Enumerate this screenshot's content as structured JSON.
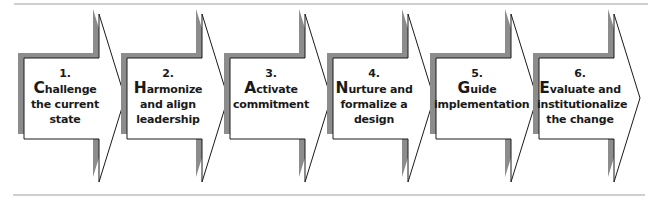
{
  "diagram": {
    "type": "process-chevrons",
    "colors": {
      "arrow_fill": "#ffffff",
      "arrow_outline": "#1a1a1a",
      "shadow": "#8c8c8c",
      "rule": "#cfcfcf",
      "text": "#1a1a1a"
    },
    "steps": [
      {
        "number": "1.",
        "initial": "C",
        "lines": [
          "hallenge",
          "the current",
          "state"
        ]
      },
      {
        "number": "2.",
        "initial": "H",
        "lines": [
          "armonize",
          "and align",
          "leadership"
        ]
      },
      {
        "number": "3.",
        "initial": "A",
        "lines": [
          "ctivate",
          "commitment",
          ""
        ]
      },
      {
        "number": "4.",
        "initial": "N",
        "lines": [
          "urture and",
          "formalize a",
          "design"
        ]
      },
      {
        "number": "5.",
        "initial": "G",
        "lines": [
          "uide",
          "implementation",
          ""
        ]
      },
      {
        "number": "6.",
        "initial": "E",
        "lines": [
          "valuate and",
          "institutionalize",
          "the change"
        ]
      }
    ]
  }
}
